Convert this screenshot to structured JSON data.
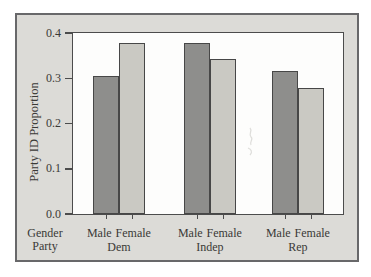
{
  "figure": {
    "bg_color": "#dcdbd7",
    "border_color": "#68686a",
    "plot_bg": "#fdfdfc"
  },
  "chart_data": {
    "type": "bar",
    "title": "",
    "ylabel": "Party ID Proportion",
    "xlabel": "",
    "row_labels": {
      "gender": "Gender",
      "party": "Party"
    },
    "categories": [
      "Dem",
      "Indep",
      "Rep"
    ],
    "x_tick_labels_per_group": [
      "Male",
      "Female"
    ],
    "series": [
      {
        "name": "Male",
        "color": "#8e8e8c",
        "values": [
          0.305,
          0.378,
          0.317
        ]
      },
      {
        "name": "Female",
        "color": "#cac9c3",
        "values": [
          0.379,
          0.342,
          0.279
        ]
      }
    ],
    "ylim": [
      0,
      0.4
    ],
    "y_ticks": [
      0.0,
      0.1,
      0.2,
      0.3,
      0.4
    ],
    "grid": false,
    "legend": "none"
  }
}
